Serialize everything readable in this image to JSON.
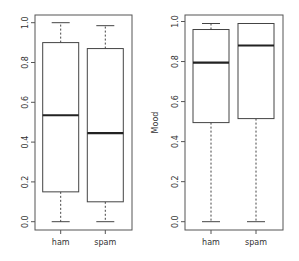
{
  "chart_data": [
    {
      "type": "boxplot",
      "title": "",
      "xlabel": "",
      "ylabel": "",
      "ylim": [
        0,
        1
      ],
      "yticks": [
        "0.0",
        "0.2",
        "0.4",
        "0.6",
        "0.8",
        "1.0"
      ],
      "ytick_values": [
        0,
        0.2,
        0.4,
        0.6,
        0.8,
        1.0
      ],
      "categories": [
        "ham",
        "spam"
      ],
      "boxes": [
        {
          "name": "ham",
          "min": 0.0,
          "q1": 0.15,
          "median": 0.535,
          "q3": 0.9,
          "max": 1.0
        },
        {
          "name": "spam",
          "min": 0.0,
          "q1": 0.1,
          "median": 0.445,
          "q3": 0.87,
          "max": 0.985
        }
      ],
      "grid": false
    },
    {
      "type": "boxplot",
      "title": "",
      "xlabel": "",
      "ylabel": "Mood",
      "ylim": [
        0,
        1
      ],
      "yticks": [
        "0.0",
        "0.2",
        "0.4",
        "0.6",
        "0.8",
        "1.0"
      ],
      "ytick_values": [
        0,
        0.2,
        0.4,
        0.6,
        0.8,
        1.0
      ],
      "categories": [
        "ham",
        "spam"
      ],
      "boxes": [
        {
          "name": "ham",
          "min": 0.0,
          "q1": 0.495,
          "median": 0.795,
          "q3": 0.96,
          "max": 0.99
        },
        {
          "name": "spam",
          "min": 0.0,
          "q1": 0.515,
          "median": 0.88,
          "q3": 0.99,
          "max": 0.99
        }
      ],
      "grid": false
    }
  ]
}
